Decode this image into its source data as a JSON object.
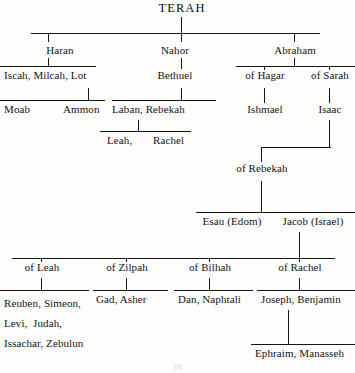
{
  "diagram": {
    "title": "TERAH",
    "page_number": "36",
    "type": "genealogy-tree",
    "ink_color": "#161616",
    "background_color": "#fdfdfb"
  },
  "generations": {
    "g1": {
      "label": "Sons of Terah",
      "nodes": [
        {
          "id": "haran",
          "label": "Haran",
          "x": 60,
          "y": 44
        },
        {
          "id": "nahor",
          "label": "Nahor",
          "x": 175,
          "y": 44
        },
        {
          "id": "abraham",
          "label": "Abraham",
          "x": 295,
          "y": 44
        }
      ]
    },
    "g2": {
      "label": "Children and wives",
      "nodes": [
        {
          "id": "haran-children",
          "label": "Iscah, Milcah, Lot",
          "x": 4,
          "y": 76
        },
        {
          "id": "bethuel",
          "label": "Bethuel",
          "x": 175,
          "y": 76
        },
        {
          "id": "of-hagar",
          "label": "of Hagar",
          "x": 265,
          "y": 76
        },
        {
          "id": "of-sarah",
          "label": "of Sarah",
          "x": 330,
          "y": 76
        }
      ]
    },
    "g3": {
      "nodes": [
        {
          "id": "moab",
          "label": "Moab",
          "x": 4,
          "y": 110
        },
        {
          "id": "ammon",
          "label": "Ammon",
          "x": 63,
          "y": 110
        },
        {
          "id": "laban-rebekah",
          "label": "Laban, Rebekah",
          "x": 112,
          "y": 110
        },
        {
          "id": "ishmael",
          "label": "Ishmael",
          "x": 265,
          "y": 110
        },
        {
          "id": "isaac",
          "label": "Isaac",
          "x": 330,
          "y": 110
        }
      ]
    },
    "g4": {
      "nodes": [
        {
          "id": "leah-comma",
          "label": "Leah,",
          "x": 107,
          "y": 141
        },
        {
          "id": "rachel",
          "label": "Rachel",
          "x": 153,
          "y": 141
        },
        {
          "id": "of-rebekah",
          "label": "of Rebekah",
          "x": 262,
          "y": 169
        }
      ]
    },
    "g5": {
      "nodes": [
        {
          "id": "esau",
          "label": "Esau (Edom)",
          "x": 232,
          "y": 222
        },
        {
          "id": "jacob",
          "label": "Jacob (Israel)",
          "x": 313,
          "y": 222
        }
      ]
    },
    "g6": {
      "label": "Wives of Jacob",
      "nodes": [
        {
          "id": "of-leah",
          "label": "of Leah",
          "x": 42,
          "y": 267
        },
        {
          "id": "of-zilpah",
          "label": "of Zilpah",
          "x": 127,
          "y": 267
        },
        {
          "id": "of-bilhah",
          "label": "of Bilhah",
          "x": 210,
          "y": 267
        },
        {
          "id": "of-rachel",
          "label": "of Rachel",
          "x": 300,
          "y": 267
        }
      ]
    },
    "g7": {
      "label": "Twelve tribes",
      "nodes": [
        {
          "id": "leah-sons",
          "label": "Reuben, Simeon,\nLevi,  Judah,\nIssachar, Zebulun",
          "x": 4,
          "y": 293
        },
        {
          "id": "zilpah-sons",
          "label": "Gad, Asher",
          "x": 96,
          "y": 293
        },
        {
          "id": "bilhah-sons",
          "label": "Dan, Naphtali",
          "x": 178,
          "y": 293
        },
        {
          "id": "rachel-sons",
          "label": "Joseph, Benjamin",
          "x": 261,
          "y": 293
        }
      ]
    },
    "g8": {
      "nodes": [
        {
          "id": "joseph-sons",
          "label": "Ephraim, Manasseh",
          "x": 255,
          "y": 348
        }
      ]
    }
  }
}
